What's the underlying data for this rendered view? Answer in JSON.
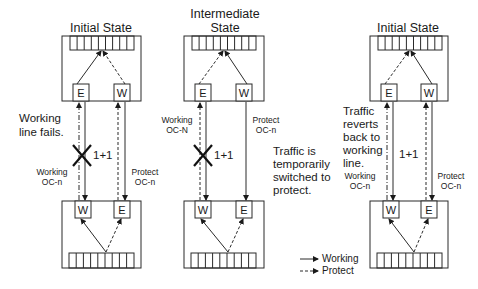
{
  "diagram": {
    "panels": [
      {
        "id": "initial",
        "title_lines": [
          "Initial State"
        ],
        "annotation": [
          "Working",
          "line fails."
        ],
        "top_ports": [
          "E",
          "W"
        ],
        "bottom_ports": [
          "W",
          "E"
        ],
        "left_line_label": [
          "Working",
          "OC-n"
        ],
        "right_line_label": [
          "Protect",
          "OC-n"
        ],
        "scheme": "1+1",
        "failure_marker": true
      },
      {
        "id": "intermediate",
        "title_lines": [
          "Intermediate",
          "State"
        ],
        "annotation": [
          "Traffic is",
          "temporarily",
          "switched to",
          "protect."
        ],
        "top_ports": [
          "E",
          "W"
        ],
        "bottom_ports": [
          "W",
          "E"
        ],
        "left_line_label": [
          "Working",
          "OC-N"
        ],
        "right_line_label": [
          "Protect",
          "OC-n"
        ],
        "scheme": "1+1",
        "failure_marker": true
      },
      {
        "id": "final",
        "title_lines": [
          "Initial State"
        ],
        "annotation": [
          "Traffic",
          "reverts",
          "back to",
          "working",
          "line."
        ],
        "top_ports": [
          "E",
          "W"
        ],
        "bottom_ports": [
          "W",
          "E"
        ],
        "left_line_label": [
          "Working",
          "OC-n"
        ],
        "right_line_label": [
          "Protect",
          "OC-n"
        ],
        "scheme": "1+1",
        "failure_marker": false
      }
    ],
    "legend": {
      "working": "Working",
      "protect": "Protect"
    }
  }
}
